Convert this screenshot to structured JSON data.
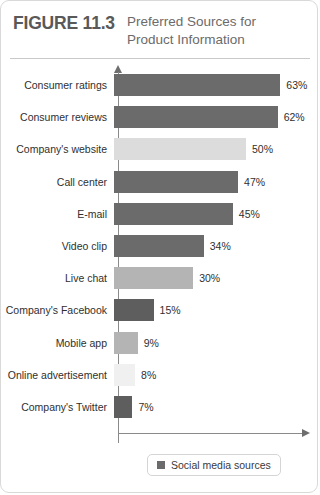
{
  "figure": {
    "number_label": "FIGURE 11.3",
    "title": "Preferred Sources for Product Information"
  },
  "legend": {
    "items": [
      {
        "label": "Social media sources",
        "color": "#6b6b6b",
        "swatch_icon": "square-swatch-icon"
      }
    ]
  },
  "colors": {
    "social_media": "#6b6b6b",
    "medium_gray": "#b4b4b4",
    "light_gray": "#dcdcdc",
    "very_light_gray": "#f0f0f0",
    "axis": "#8a8a8a",
    "text": "#2f2f2f",
    "title": "#6b6b6b"
  },
  "chart_data": {
    "type": "bar",
    "orientation": "horizontal",
    "title": "Preferred Sources for Product Information",
    "xlabel": "",
    "ylabel": "",
    "xlim": [
      0,
      70
    ],
    "grid": false,
    "legend_position": "bottom",
    "value_suffix": "%",
    "categories": [
      "Consumer ratings",
      "Consumer reviews",
      "Company's website",
      "Call center",
      "E-mail",
      "Video clip",
      "Live chat",
      "Company's Facebook",
      "Mobile app",
      "Online advertisement",
      "Company's Twitter"
    ],
    "values": [
      63,
      62,
      50,
      47,
      45,
      34,
      30,
      15,
      9,
      8,
      7
    ],
    "value_labels": [
      "63%",
      "62%",
      "50%",
      "47%",
      "45%",
      "34%",
      "30%",
      "15%",
      "9%",
      "8%",
      "7%"
    ],
    "bar_colors": [
      "#6b6b6b",
      "#6b6b6b",
      "#dcdcdc",
      "#6b6b6b",
      "#6b6b6b",
      "#6b6b6b",
      "#b4b4b4",
      "#5e5e5e",
      "#b4b4b4",
      "#f0f0f0",
      "#5e5e5e"
    ],
    "series": [
      {
        "name": "Social media sources",
        "color": "#6b6b6b",
        "values": [
          63,
          62,
          50,
          47,
          45,
          34,
          30,
          15,
          9,
          8,
          7
        ]
      }
    ]
  }
}
